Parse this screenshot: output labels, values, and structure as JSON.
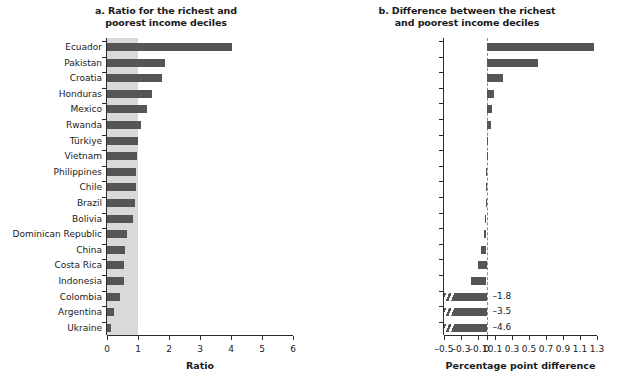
{
  "figure": {
    "width": 620,
    "height": 382,
    "bar_color": "#555555",
    "band_color": "#d9d9d9"
  },
  "panel_a": {
    "title_line1": "a. Ratio for the richest and",
    "title_line2": "poorest income deciles",
    "xlabel": "Ratio",
    "xticks": [
      "0",
      "1",
      "2",
      "3",
      "4",
      "5",
      "6"
    ]
  },
  "panel_b": {
    "title_line1": "b. Difference between the richest",
    "title_line2": "and poorest income deciles",
    "xlabel": "Percentage point difference",
    "xticks": [
      "-0.5",
      "-0.3",
      "-0.1",
      "0",
      "0.1",
      "0.3",
      "0.5",
      "0.7",
      "0.9",
      "1.1",
      "1.3"
    ]
  },
  "chart_data": [
    {
      "type": "bar",
      "orientation": "horizontal",
      "title": "a. Ratio for the richest and poorest income deciles",
      "xlabel": "Ratio",
      "ylabel": "",
      "xlim": [
        0,
        6
      ],
      "xticks": [
        0,
        1,
        2,
        3,
        4,
        5,
        6
      ],
      "grid": false,
      "legend": "none",
      "reference_band": [
        0,
        1
      ],
      "categories": [
        "Pakistan",
        "Ecuador",
        "Croatia",
        "Rwanda",
        "Mexico",
        "Honduras",
        "Türkiye",
        "Philippines",
        "Bolivia",
        "Vietnam",
        "Chile",
        "Indonesia",
        "Argentina",
        "Dominican Republic",
        "Ukraine",
        "Colombia",
        "China",
        "Brazil",
        "Costa Rica"
      ],
      "values": [
        4.03,
        1.87,
        1.77,
        1.45,
        1.29,
        1.1,
        0.99,
        0.97,
        0.95,
        0.95,
        0.89,
        0.84,
        0.66,
        0.57,
        0.56,
        0.54,
        0.42,
        0.23,
        0.13
      ]
    },
    {
      "type": "bar",
      "orientation": "horizontal",
      "title": "b. Difference between the richest and poorest income deciles",
      "xlabel": "Percentage point difference",
      "ylabel": "",
      "xlim": [
        -0.5,
        1.3
      ],
      "xticks": [
        -0.5,
        -0.3,
        -0.1,
        0,
        0.1,
        0.3,
        0.5,
        0.7,
        0.9,
        1.1,
        1.3
      ],
      "grid": false,
      "legend": "none",
      "zero_reference": 0,
      "axis_break": true,
      "categories": [
        "Ecuador",
        "Pakistan",
        "Croatia",
        "Honduras",
        "Mexico",
        "Rwanda",
        "Türkiye",
        "Vietnam",
        "Philippines",
        "Chile",
        "Brazil",
        "Bolivia",
        "Dominican Republic",
        "China",
        "Costa Rica",
        "Indonesia",
        "Colombia",
        "Argentina",
        "Ukraine"
      ],
      "values": [
        1.26,
        0.61,
        0.19,
        0.09,
        0.07,
        0.05,
        0.005,
        0.004,
        -0.004,
        -0.006,
        -0.008,
        -0.015,
        -0.03,
        -0.07,
        -0.1,
        -0.18,
        -1.8,
        -3.5,
        -4.6
      ],
      "value_labels": [
        "",
        "",
        "",
        "",
        "",
        "",
        "",
        "",
        "",
        "",
        "",
        "",
        "",
        "",
        "",
        "",
        "–1.8",
        "–3.5",
        "–4.6"
      ],
      "truncated_rows": [
        "Colombia",
        "Argentina",
        "Ukraine"
      ]
    }
  ]
}
